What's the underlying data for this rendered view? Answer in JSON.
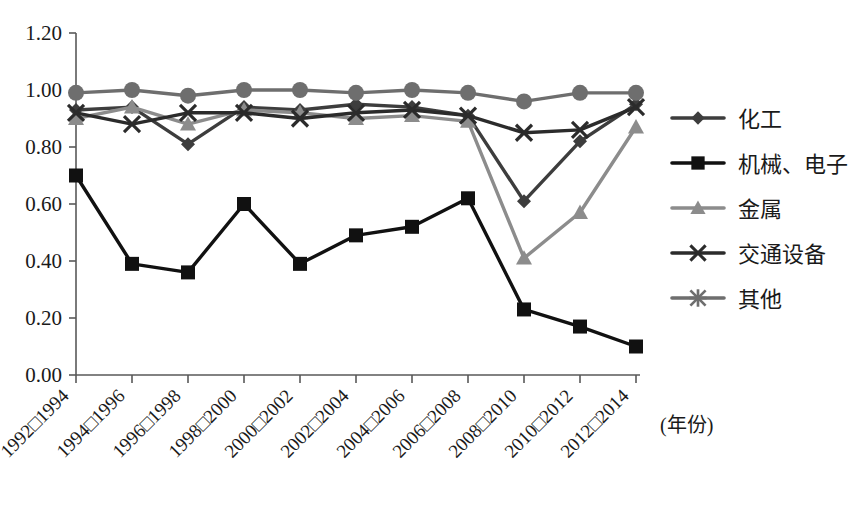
{
  "chart_data": {
    "type": "line",
    "title": "",
    "xlabel": "(年份)",
    "ylabel": "",
    "ylim": [
      0.0,
      1.2
    ],
    "ytick_labels": [
      "0.00",
      "0.20",
      "0.40",
      "0.60",
      "0.80",
      "1.00",
      "1.20"
    ],
    "ytick_values": [
      0.0,
      0.2,
      0.4,
      0.6,
      0.8,
      1.0,
      1.2
    ],
    "grid": false,
    "legend_position": "right",
    "categories": [
      "1992□1994",
      "1994□1996",
      "1996□1998",
      "1998□2000",
      "2000□2002",
      "2002□2004",
      "2004□2006",
      "2006□2008",
      "2008□2010",
      "2010□2012",
      "2012□2014"
    ],
    "series": [
      {
        "name": "化工",
        "marker": "diamond",
        "color": "#3d3d3d",
        "values": [
          0.93,
          0.94,
          0.81,
          0.94,
          0.93,
          0.95,
          0.94,
          0.91,
          0.61,
          0.82,
          0.95
        ]
      },
      {
        "name": "机械、电子",
        "marker": "square",
        "color": "#111111",
        "values": [
          0.7,
          0.39,
          0.36,
          0.6,
          0.39,
          0.49,
          0.52,
          0.62,
          0.23,
          0.17,
          0.1
        ]
      },
      {
        "name": "金属",
        "marker": "triangle",
        "color": "#8c8c8c",
        "values": [
          0.9,
          0.94,
          0.88,
          0.93,
          0.92,
          0.9,
          0.91,
          0.89,
          0.41,
          0.57,
          0.87
        ]
      },
      {
        "name": "交通设备",
        "marker": "cross",
        "color": "#2b2b2b",
        "values": [
          0.92,
          0.88,
          0.92,
          0.92,
          0.9,
          0.92,
          0.93,
          0.91,
          0.85,
          0.86,
          0.94
        ]
      },
      {
        "name": "其他",
        "marker": "star",
        "color": "#6e6e6e",
        "values": [
          0.99,
          1.0,
          0.98,
          1.0,
          1.0,
          0.99,
          1.0,
          0.99,
          0.96,
          0.99,
          0.99
        ]
      }
    ]
  },
  "legend": {
    "items": [
      {
        "label": "化工",
        "marker": "diamond-icon",
        "color": "#3d3d3d"
      },
      {
        "label": "机械、电子",
        "marker": "square-icon",
        "color": "#111111"
      },
      {
        "label": "金属",
        "marker": "triangle-icon",
        "color": "#8c8c8c"
      },
      {
        "label": "交通设备",
        "marker": "cross-icon",
        "color": "#2b2b2b"
      },
      {
        "label": "其他",
        "marker": "star-icon",
        "color": "#6e6e6e"
      }
    ]
  }
}
